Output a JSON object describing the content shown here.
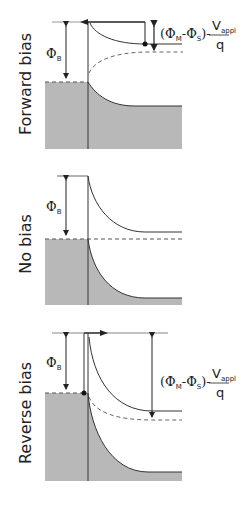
{
  "figure": {
    "panels": [
      {
        "id": "forward",
        "label": "Forward bias",
        "barrier_symbol": "Φ",
        "barrier_sub": "B",
        "annotation": {
          "lhs_open": "(Φ",
          "lhs_sub1": "M",
          "lhs_mid": "-Φ",
          "lhs_sub2": "S",
          "lhs_close": ")-",
          "numerator": "V",
          "numerator_sub": "appl",
          "denominator": "q"
        }
      },
      {
        "id": "none",
        "label": "No bias",
        "barrier_symbol": "Φ",
        "barrier_sub": "B"
      },
      {
        "id": "reverse",
        "label": "Reverse bias",
        "barrier_symbol": "Φ",
        "barrier_sub": "B",
        "annotation": {
          "lhs_open": "(Φ",
          "lhs_sub1": "M",
          "lhs_mid": "-Φ",
          "lhs_sub2": "S",
          "lhs_close": ")-",
          "numerator": "V",
          "numerator_sub": "appl",
          "denominator": "q"
        }
      }
    ],
    "colors": {
      "fill": "#b8b8b8",
      "line": "#333333",
      "dash": "#555555"
    }
  }
}
